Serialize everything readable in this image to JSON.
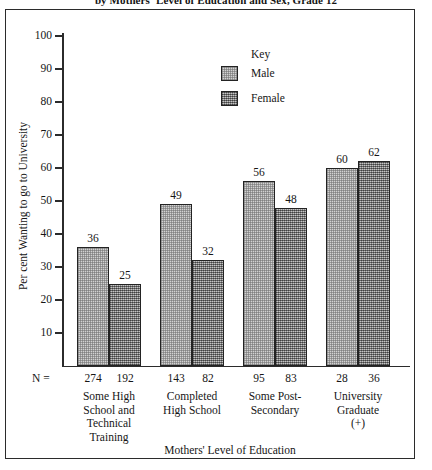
{
  "figure": {
    "title": "by Mothers' Level of Education and Sex, Grade 12",
    "n_prefix": "N =",
    "legend_title": "Key"
  },
  "chart_data": {
    "type": "bar",
    "title": "by Mothers' Level of Education and Sex, Grade 12",
    "xlabel": "Mothers' Level of Education",
    "ylabel": "Per cent Wanting to go to University",
    "ylim": [
      0,
      100
    ],
    "yticks": [
      10,
      20,
      30,
      40,
      50,
      60,
      70,
      80,
      90,
      100
    ],
    "ytick_labels": [
      "10",
      "20",
      "30",
      "40",
      "50",
      "60",
      "70",
      "80",
      "90",
      "100"
    ],
    "grid": false,
    "legend_position": "top-center-right",
    "categories": [
      "Some High School and Technical Training",
      "Completed High School",
      "Some Post-Secondary",
      "University Graduate (+)"
    ],
    "category_lines": [
      [
        "Some High",
        "School and",
        "Technical",
        "Training"
      ],
      [
        "Completed",
        "High School"
      ],
      [
        "Some Post-",
        "Secondary"
      ],
      [
        "University",
        "Graduate",
        "(+)"
      ]
    ],
    "series": [
      {
        "name": "Male",
        "values": [
          36,
          49,
          56,
          60
        ],
        "n": [
          274,
          143,
          95,
          28
        ],
        "color": "#d2d2d2"
      },
      {
        "name": "Female",
        "values": [
          25,
          32,
          48,
          62
        ],
        "n": [
          192,
          82,
          83,
          36
        ],
        "color": "#8e8e8e"
      }
    ]
  }
}
